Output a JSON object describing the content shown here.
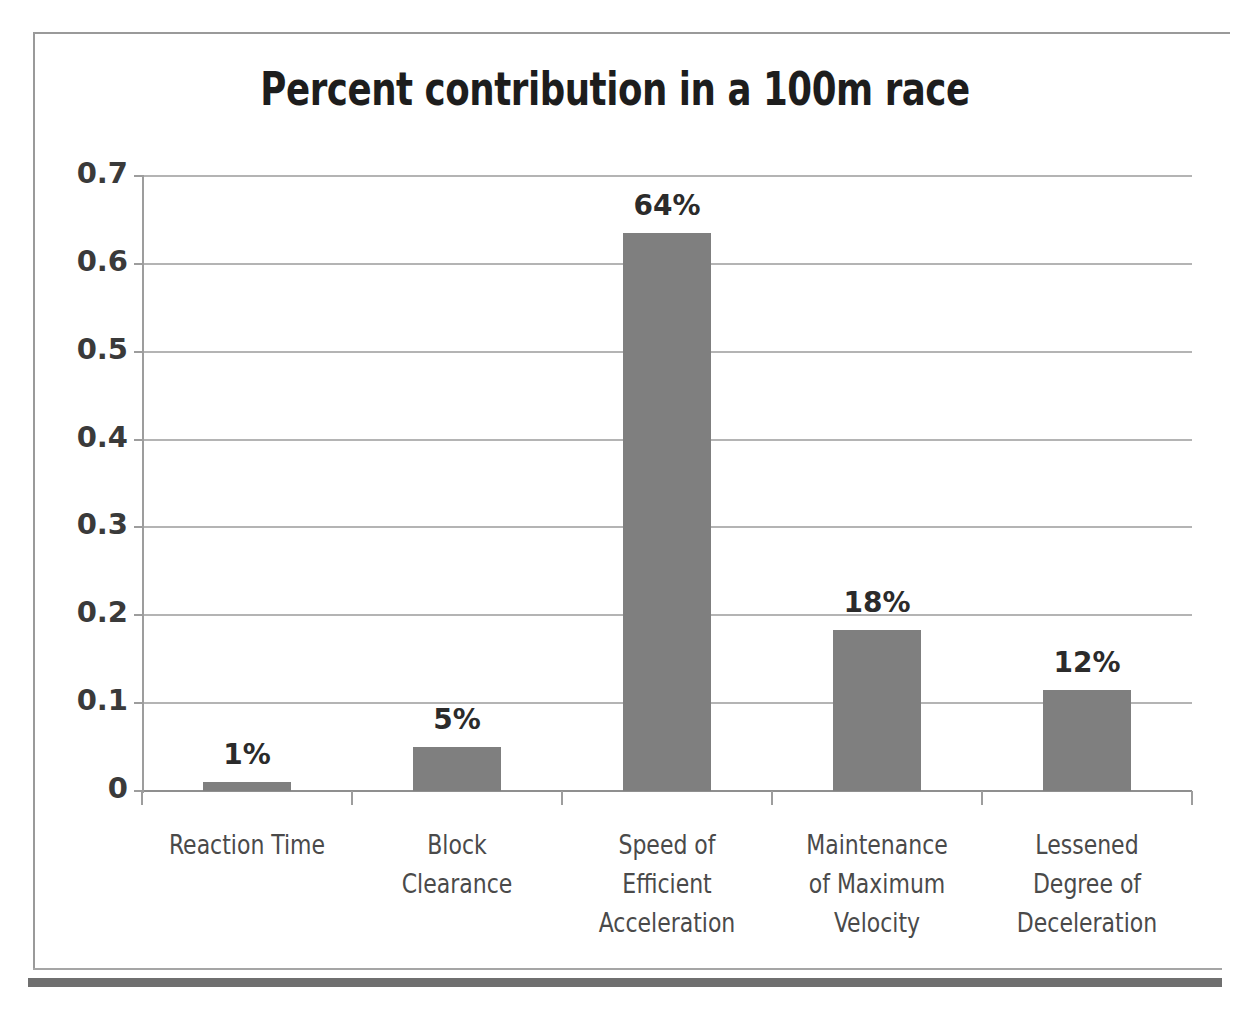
{
  "chart_data": {
    "type": "bar",
    "title": "Percent contribution in a 100m race",
    "xlabel": "",
    "ylabel": "",
    "ylim": [
      0,
      0.7
    ],
    "grid": true,
    "legend": "none",
    "categories": [
      "Reaction Time",
      "Block Clearance",
      "Speed of Efficient Acceleration",
      "Maintenance of Maximum Velocity",
      "Lessened Degree of Deceleration"
    ],
    "category_lines": [
      [
        "Reaction Time"
      ],
      [
        "Block",
        "Clearance"
      ],
      [
        "Speed of",
        "Efficient",
        "Acceleration"
      ],
      [
        "Maintenance",
        "of Maximum",
        "Velocity"
      ],
      [
        "Lessened",
        "Degree of",
        "Deceleration"
      ]
    ],
    "values": [
      0.01,
      0.05,
      0.635,
      0.183,
      0.115
    ],
    "data_labels": [
      "1%",
      "5%",
      "64%",
      "18%",
      "12%"
    ],
    "ytick_labels": [
      "0.7",
      "0.6",
      "0.5",
      "0.4",
      "0.3",
      "0.2",
      "0.1",
      "0"
    ],
    "ytick_values": [
      0.7,
      0.6,
      0.5,
      0.4,
      0.3,
      0.2,
      0.1,
      0
    ],
    "bar_color": "#7f7f7f",
    "gridline_color": "#b4b4b4",
    "axis_color": "#9d9d9d",
    "title_color": "#1d1d1d",
    "background_color": "#ffffff"
  }
}
